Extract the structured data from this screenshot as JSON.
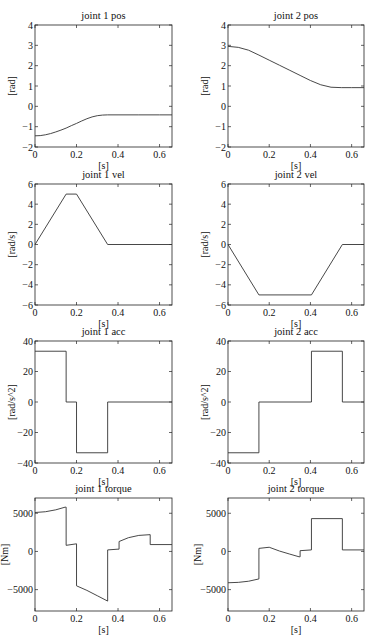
{
  "figure": {
    "width": 372,
    "height": 643
  },
  "chart_data": [
    {
      "id": "j1pos",
      "type": "line",
      "title": "joint 1 pos",
      "xlabel": "[s]",
      "ylabel": "[rad]",
      "xlim": [
        0,
        0.66
      ],
      "ylim": [
        -2,
        4
      ],
      "xticks": [
        0,
        0.2,
        0.4,
        0.6
      ],
      "xticklabels": [
        "0",
        "0.2",
        "0.4",
        "0.6"
      ],
      "yticks": [
        -2,
        -1,
        0,
        1,
        2,
        3,
        4
      ],
      "yticklabels": [
        "−2",
        "−1",
        "0",
        "1",
        "2",
        "3",
        "4"
      ],
      "box": {
        "left": 35,
        "top": 25,
        "right": 172,
        "bottom": 147
      },
      "x": [
        0,
        0.025,
        0.05,
        0.075,
        0.1,
        0.125,
        0.15,
        0.175,
        0.2,
        0.225,
        0.25,
        0.275,
        0.3,
        0.325,
        0.35,
        0.4,
        0.5,
        0.6,
        0.66
      ],
      "y": [
        -1.45,
        -1.44,
        -1.4,
        -1.34,
        -1.26,
        -1.17,
        -1.07,
        -0.95,
        -0.84,
        -0.72,
        -0.61,
        -0.52,
        -0.46,
        -0.43,
        -0.42,
        -0.42,
        -0.42,
        -0.42,
        -0.42
      ]
    },
    {
      "id": "j2pos",
      "type": "line",
      "title": "joint 2 pos",
      "xlabel": "[s]",
      "ylabel": "[rad]",
      "xlim": [
        0,
        0.66
      ],
      "ylim": [
        -2,
        4
      ],
      "xticks": [
        0,
        0.2,
        0.4,
        0.6
      ],
      "xticklabels": [
        "0",
        "0.2",
        "0.4",
        "0.6"
      ],
      "yticks": [
        -2,
        -1,
        0,
        1,
        2,
        3,
        4
      ],
      "yticklabels": [
        "−2",
        "−1",
        "0",
        "1",
        "2",
        "3",
        "4"
      ],
      "box": {
        "left": 228,
        "top": 25,
        "right": 364,
        "bottom": 147
      },
      "x": [
        0,
        0.05,
        0.1,
        0.15,
        0.2,
        0.25,
        0.3,
        0.35,
        0.4,
        0.45,
        0.5,
        0.55,
        0.6,
        0.66
      ],
      "y": [
        2.95,
        2.9,
        2.76,
        2.52,
        2.27,
        2.02,
        1.77,
        1.52,
        1.27,
        1.06,
        0.94,
        0.92,
        0.92,
        0.92
      ]
    },
    {
      "id": "j1vel",
      "type": "line",
      "title": "joint 1 vel",
      "xlabel": "[s]",
      "ylabel": "[rad/s]",
      "xlim": [
        0,
        0.66
      ],
      "ylim": [
        -6,
        6
      ],
      "xticks": [
        0,
        0.2,
        0.4,
        0.6
      ],
      "xticklabels": [
        "0",
        "0.2",
        "0.4",
        "0.6"
      ],
      "yticks": [
        -6,
        -4,
        -2,
        0,
        2,
        4,
        6
      ],
      "yticklabels": [
        "−6",
        "−4",
        "−2",
        "0",
        "2",
        "4",
        "6"
      ],
      "box": {
        "left": 35,
        "top": 184,
        "right": 172,
        "bottom": 305
      },
      "x": [
        0,
        0.15,
        0.2,
        0.35,
        0.66
      ],
      "y": [
        0,
        5,
        5,
        0,
        0
      ]
    },
    {
      "id": "j2vel",
      "type": "line",
      "title": "joint 2 vel",
      "xlabel": "[s]",
      "ylabel": "[rad/s]",
      "xlim": [
        0,
        0.66
      ],
      "ylim": [
        -6,
        6
      ],
      "xticks": [
        0,
        0.2,
        0.4,
        0.6
      ],
      "xticklabels": [
        "0",
        "0.2",
        "0.4",
        "0.6"
      ],
      "yticks": [
        -6,
        -4,
        -2,
        0,
        2,
        4,
        6
      ],
      "yticklabels": [
        "−6",
        "−4",
        "−2",
        "0",
        "2",
        "4",
        "6"
      ],
      "box": {
        "left": 228,
        "top": 184,
        "right": 364,
        "bottom": 305
      },
      "x": [
        0,
        0.15,
        0.405,
        0.555,
        0.66
      ],
      "y": [
        0,
        -5,
        -5,
        0,
        0
      ]
    },
    {
      "id": "j1acc",
      "type": "line",
      "title": "joint 1 acc",
      "xlabel": "[s]",
      "ylabel": "[rad/s^2]",
      "xlim": [
        0,
        0.66
      ],
      "ylim": [
        -40,
        40
      ],
      "xticks": [
        0,
        0.2,
        0.4,
        0.6
      ],
      "xticklabels": [
        "0",
        "0.2",
        "0.4",
        "0.6"
      ],
      "yticks": [
        -40,
        -20,
        0,
        20,
        40
      ],
      "yticklabels": [
        "−40",
        "−20",
        "0",
        "20",
        "40"
      ],
      "box": {
        "left": 35,
        "top": 341,
        "right": 172,
        "bottom": 463
      },
      "x": [
        0,
        0.15,
        0.15,
        0.2,
        0.2,
        0.35,
        0.35,
        0.66
      ],
      "y": [
        33.3,
        33.3,
        0,
        0,
        -33.3,
        -33.3,
        0,
        0
      ]
    },
    {
      "id": "j2acc",
      "type": "line",
      "title": "joint 2 acc",
      "xlabel": "[s]",
      "ylabel": "[rad/s^2]",
      "xlim": [
        0,
        0.66
      ],
      "ylim": [
        -40,
        40
      ],
      "xticks": [
        0,
        0.2,
        0.4,
        0.6
      ],
      "xticklabels": [
        "0",
        "0.2",
        "0.4",
        "0.6"
      ],
      "yticks": [
        -40,
        -20,
        0,
        20,
        40
      ],
      "yticklabels": [
        "−40",
        "−20",
        "0",
        "20",
        "40"
      ],
      "box": {
        "left": 228,
        "top": 341,
        "right": 364,
        "bottom": 463
      },
      "x": [
        0,
        0.15,
        0.15,
        0.405,
        0.405,
        0.555,
        0.555,
        0.66
      ],
      "y": [
        -33.3,
        -33.3,
        0,
        0,
        33.3,
        33.3,
        0,
        0
      ]
    },
    {
      "id": "j1torque",
      "type": "line",
      "title": "joint 1 torque",
      "xlabel": "[s]",
      "ylabel": "[Nm]",
      "xlim": [
        0,
        0.66
      ],
      "ylim": [
        -7800,
        7000
      ],
      "xticks": [
        0,
        0.2,
        0.4,
        0.6
      ],
      "xticklabels": [
        "0",
        "0.2",
        "0.4",
        "0.6"
      ],
      "yticks": [
        -5000,
        0,
        5000
      ],
      "yticklabels": [
        "−5000",
        "0",
        "5000"
      ],
      "box": {
        "left": 35,
        "top": 498,
        "right": 172,
        "bottom": 611
      },
      "x": [
        0,
        0.05,
        0.1,
        0.145,
        0.15,
        0.15,
        0.2,
        0.2,
        0.25,
        0.3,
        0.35,
        0.35,
        0.4,
        0.405,
        0.405,
        0.45,
        0.5,
        0.555,
        0.555,
        0.66
      ],
      "y": [
        5100,
        5200,
        5450,
        5800,
        5800,
        800,
        1000,
        -4500,
        -5100,
        -5800,
        -6500,
        200,
        300,
        300,
        1300,
        1800,
        2100,
        2200,
        900,
        900
      ]
    },
    {
      "id": "j2torque",
      "type": "line",
      "title": "joint 2 torque",
      "xlabel": "[s]",
      "ylabel": "[Nm]",
      "xlim": [
        0,
        0.66
      ],
      "ylim": [
        -7800,
        7000
      ],
      "xticks": [
        0,
        0.2,
        0.4,
        0.6
      ],
      "xticklabels": [
        "0",
        "0.2",
        "0.4",
        "0.6"
      ],
      "yticks": [
        -5000,
        0,
        5000
      ],
      "yticklabels": [
        "−5000",
        "0",
        "5000"
      ],
      "box": {
        "left": 228,
        "top": 498,
        "right": 364,
        "bottom": 611
      },
      "x": [
        0,
        0.05,
        0.1,
        0.15,
        0.15,
        0.2,
        0.25,
        0.3,
        0.345,
        0.35,
        0.35,
        0.405,
        0.405,
        0.555,
        0.555,
        0.66
      ],
      "y": [
        -4100,
        -4050,
        -3900,
        -3600,
        400,
        550,
        50,
        -350,
        -700,
        -700,
        100,
        200,
        4300,
        4300,
        200,
        200
      ]
    }
  ]
}
